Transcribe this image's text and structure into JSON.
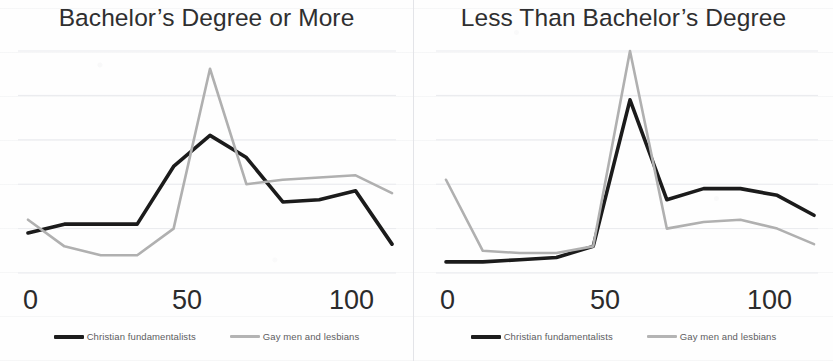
{
  "figure": {
    "legend": [
      {
        "name": "christian-fundamentalists",
        "label": "Christian fundamentalists",
        "color": "#1b1b1b"
      },
      {
        "name": "gay-men-and-lesbians",
        "label": "Gay men and lesbians",
        "color": "#b0b0b0"
      }
    ],
    "x_ticks": [
      "0",
      "50",
      "100"
    ]
  },
  "chart_data": [
    {
      "type": "line",
      "title": "Bachelor’s Degree or More",
      "xlabel": "",
      "ylabel": "",
      "xlim": [
        0,
        100
      ],
      "ylim": [
        0,
        100
      ],
      "xticks": [
        0,
        50,
        100
      ],
      "grid": true,
      "legend_position": "bottom",
      "x": [
        0,
        10,
        20,
        30,
        40,
        50,
        60,
        70,
        80,
        90,
        100
      ],
      "series": [
        {
          "name": "Christian fundamentalists",
          "color": "#1b1b1b",
          "values": [
            18,
            22,
            22,
            22,
            48,
            62,
            52,
            32,
            33,
            37,
            13
          ]
        },
        {
          "name": "Gay men and lesbians",
          "color": "#b0b0b0",
          "values": [
            24,
            12,
            8,
            8,
            20,
            92,
            40,
            42,
            43,
            44,
            36
          ]
        }
      ]
    },
    {
      "type": "line",
      "title": "Less Than Bachelor’s Degree",
      "xlabel": "",
      "ylabel": "",
      "xlim": [
        0,
        100
      ],
      "ylim": [
        0,
        100
      ],
      "xticks": [
        0,
        50,
        100
      ],
      "grid": true,
      "legend_position": "bottom",
      "x": [
        0,
        10,
        20,
        30,
        40,
        50,
        60,
        70,
        80,
        90,
        100
      ],
      "series": [
        {
          "name": "Christian fundamentalists",
          "color": "#1b1b1b",
          "values": [
            5,
            5,
            6,
            7,
            12,
            78,
            33,
            38,
            38,
            35,
            26
          ]
        },
        {
          "name": "Gay men and lesbians",
          "color": "#b0b0b0",
          "values": [
            42,
            10,
            9,
            9,
            12,
            100,
            20,
            23,
            24,
            20,
            13
          ]
        }
      ]
    }
  ]
}
